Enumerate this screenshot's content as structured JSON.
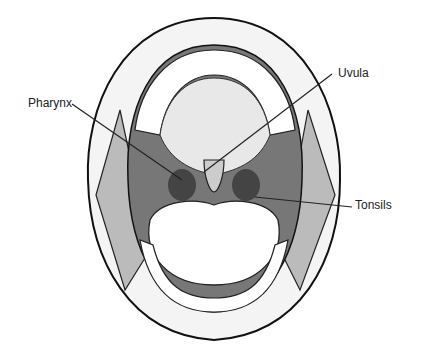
{
  "diagram": {
    "labels": [
      {
        "text": "Pharynx",
        "x": 28,
        "y": 96
      },
      {
        "text": "Uvula",
        "x": 338,
        "y": 66
      },
      {
        "text": "Tonsils",
        "x": 355,
        "y": 198
      }
    ]
  }
}
